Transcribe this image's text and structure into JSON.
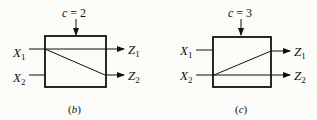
{
  "diagrams": [
    {
      "id": "b",
      "control_label": "c = 2",
      "inputs": [
        "X1",
        "X2"
      ],
      "outputs": [
        "Z1",
        "Z2"
      ],
      "caption": "(b)",
      "connections": [
        {
          "from": "X1",
          "to": "Z1"
        },
        {
          "from": "X1",
          "to": "Z2"
        }
      ]
    },
    {
      "id": "c",
      "control_label": "c = 3",
      "inputs": [
        "X1",
        "X2"
      ],
      "outputs": [
        "Z1",
        "Z2"
      ],
      "caption": "(c)",
      "connections": [
        {
          "from": "X2",
          "to": "Z1"
        },
        {
          "from": "X2",
          "to": "Z2"
        }
      ]
    }
  ],
  "colors": {
    "stroke": "#111111",
    "background": "#fbfbf8"
  }
}
